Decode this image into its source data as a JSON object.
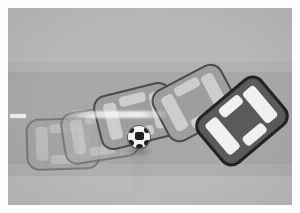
{
  "scene": {
    "title": "Top-down motion sequence of a car collision test with a soccer ball",
    "kind": "grayscale-photo-sequence",
    "width": 300,
    "height": 213,
    "border_color": "#fdfdfd",
    "border_width": 8
  },
  "bands": [
    {
      "name": "upper-ground",
      "label": "upper ground",
      "top": 0,
      "height": 54,
      "color": "#b9b9b9"
    },
    {
      "name": "upper-shoulder",
      "label": "upper shoulder",
      "top": 54,
      "height": 10,
      "color": "#b3b3b3"
    },
    {
      "name": "roadway",
      "label": "roadway",
      "top": 64,
      "height": 92,
      "color": "#a8a8a8"
    },
    {
      "name": "lower-shoulder",
      "label": "lower shoulder",
      "top": 156,
      "height": 12,
      "color": "#b0b0b0"
    },
    {
      "name": "lower-ground",
      "label": "lower ground",
      "top": 168,
      "height": 29,
      "color": "#bcbcbc"
    }
  ],
  "lane_markings": {
    "color": "#f2f2f2",
    "y": 106,
    "height": 4,
    "dashes": [
      {
        "x": 2,
        "width": 16
      },
      {
        "x": 70,
        "width": 22
      },
      {
        "x": 104,
        "width": 30
      },
      {
        "x": 140,
        "width": 26
      },
      {
        "x": 188,
        "width": 24
      },
      {
        "x": 232,
        "width": 14
      }
    ]
  },
  "motion_streak": {
    "x": 60,
    "y": 104,
    "width": 100,
    "height": 7,
    "color": "#ffffff"
  },
  "cars": [
    {
      "name": "car-frame-1",
      "label": "Car ghost frame 1",
      "x": 26,
      "y": 114,
      "width": 74,
      "height": 52,
      "rotation": -2,
      "style": "ghost",
      "body_color": "#a4a4a4",
      "glass_color": "#c2c2c2",
      "opacity": 0.8
    },
    {
      "name": "car-frame-2",
      "label": "Car ghost frame 2",
      "x": 62,
      "y": 104,
      "width": 76,
      "height": 53,
      "rotation": -9,
      "style": "ghost2",
      "body_color": "#a9a9a9",
      "glass_color": "#c6c6c6",
      "opacity": 0.82
    },
    {
      "name": "car-frame-3",
      "label": "Car mid frame 3",
      "x": 96,
      "y": 84,
      "width": 80,
      "height": 56,
      "rotation": -14,
      "style": "mid",
      "body_color": "#9e9e9e",
      "glass_color": "#cfcfcf",
      "opacity": 0.92
    },
    {
      "name": "car-frame-4",
      "label": "Car mid frame 4",
      "x": 156,
      "y": 70,
      "width": 78,
      "height": 58,
      "rotation": -28,
      "style": "mid",
      "body_color": "#9b9b9b",
      "glass_color": "#cccccc",
      "opacity": 0.95
    },
    {
      "name": "car-final",
      "label": "Car final dark frame",
      "x": 200,
      "y": 86,
      "width": 84,
      "height": 62,
      "rotation": -40,
      "style": "final",
      "body_color": "#585858",
      "glass_color": "#f4f4f4",
      "opacity": 1
    }
  ],
  "ball": {
    "name": "soccer-ball",
    "label": "Soccer ball",
    "x": 128,
    "y": 126,
    "size": 22,
    "base_color": "#f5f5f5",
    "panel_color": "#1a1a1a"
  },
  "ball_ghosts": [
    {
      "x": 130,
      "y": 148,
      "size": 18,
      "opacity": 0.3
    },
    {
      "x": 131,
      "y": 164,
      "size": 16,
      "opacity": 0.2
    },
    {
      "x": 132,
      "y": 177,
      "size": 14,
      "opacity": 0.12
    }
  ]
}
